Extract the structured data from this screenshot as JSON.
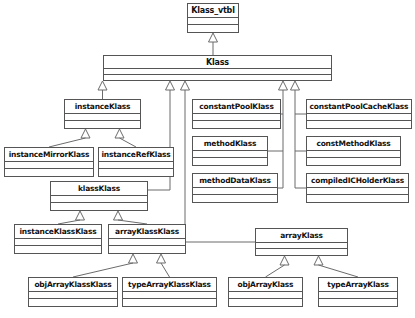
{
  "diagram": {
    "type": "uml-class-diagram",
    "background_color": "#ffffff",
    "box_fill_color": "#ffffff",
    "box_border_color": "#555555",
    "text_color": "#111111",
    "edge_color": "#6b6b6b",
    "relationship_type": "generalization",
    "caption": "",
    "classes": [
      {
        "id": "klass_vtbl",
        "name": "Klass_vtbl",
        "x": 187,
        "y": 3,
        "w": 52,
        "h": 30,
        "font_size": 8,
        "name_h": 14
      },
      {
        "id": "klass",
        "name": "Klass",
        "x": 103,
        "y": 55,
        "w": 229,
        "h": 26,
        "font_size": 8,
        "name_h": 13
      },
      {
        "id": "instanceKlass",
        "name": "instanceKlass",
        "x": 64,
        "y": 99,
        "w": 77,
        "h": 30,
        "font_size": 7.5,
        "name_h": 14
      },
      {
        "id": "constantPoolKlass",
        "name": "constantPoolKlass",
        "x": 192,
        "y": 99,
        "w": 89,
        "h": 30,
        "font_size": 7.5,
        "name_h": 14
      },
      {
        "id": "constantPoolCacheKlass",
        "name": "constantPoolCacheKlass",
        "x": 306,
        "y": 99,
        "w": 106,
        "h": 30,
        "font_size": 7.5,
        "name_h": 14
      },
      {
        "id": "methodKlass",
        "name": "methodKlass",
        "x": 192,
        "y": 136,
        "w": 76,
        "h": 30,
        "font_size": 7.5,
        "name_h": 14
      },
      {
        "id": "constMethodKlass",
        "name": "constMethodKlass",
        "x": 306,
        "y": 136,
        "w": 95,
        "h": 30,
        "font_size": 7.5,
        "name_h": 14
      },
      {
        "id": "instanceMirrorKlass",
        "name": "instanceMirrorKlass",
        "x": 4,
        "y": 147,
        "w": 90,
        "h": 30,
        "font_size": 7.5,
        "name_h": 14
      },
      {
        "id": "instanceRefKlass",
        "name": "instanceRefKlass",
        "x": 98,
        "y": 147,
        "w": 76,
        "h": 30,
        "font_size": 7.5,
        "name_h": 14
      },
      {
        "id": "methodDataKlass",
        "name": "methodDataKlass",
        "x": 192,
        "y": 173,
        "w": 86,
        "h": 30,
        "font_size": 7.5,
        "name_h": 14
      },
      {
        "id": "compiledICHolderKlass",
        "name": "compiledICHolderKlass",
        "x": 306,
        "y": 173,
        "w": 103,
        "h": 30,
        "font_size": 7.5,
        "name_h": 14
      },
      {
        "id": "klassKlass",
        "name": "klassKlass",
        "x": 50,
        "y": 181,
        "w": 98,
        "h": 30,
        "font_size": 7.5,
        "name_h": 14
      },
      {
        "id": "instanceKlassKlass",
        "name": "instanceKlassKlass",
        "x": 14,
        "y": 224,
        "w": 88,
        "h": 30,
        "font_size": 7.5,
        "name_h": 14
      },
      {
        "id": "arrayKlassKlass",
        "name": "arrayKlassKlass",
        "x": 108,
        "y": 224,
        "w": 78,
        "h": 30,
        "font_size": 7.5,
        "name_h": 14
      },
      {
        "id": "arrayKlass",
        "name": "arrayKlass",
        "x": 255,
        "y": 228,
        "w": 93,
        "h": 28,
        "font_size": 7.5,
        "name_h": 14
      },
      {
        "id": "objArrayKlassKlass",
        "name": "objArrayKlassKlass",
        "x": 28,
        "y": 277,
        "w": 90,
        "h": 30,
        "font_size": 7.5,
        "name_h": 14
      },
      {
        "id": "typeArrayKlassKlass",
        "name": "typeArrayKlassKlass",
        "x": 122,
        "y": 277,
        "w": 95,
        "h": 30,
        "font_size": 7.5,
        "name_h": 14
      },
      {
        "id": "objArrayKlass",
        "name": "objArrayKlass",
        "x": 228,
        "y": 277,
        "w": 75,
        "h": 30,
        "font_size": 7.5,
        "name_h": 14
      },
      {
        "id": "typeArrayKlass",
        "name": "typeArrayKlass",
        "x": 318,
        "y": 277,
        "w": 80,
        "h": 30,
        "font_size": 7.5,
        "name_h": 14
      }
    ],
    "edges": [
      {
        "from": "klass",
        "to": "klass_vtbl",
        "label": "extends"
      },
      {
        "from": "instanceKlass",
        "to": "klass",
        "label": "extends"
      },
      {
        "from": "klassKlass",
        "to": "klass",
        "label": "extends"
      },
      {
        "from": "arrayKlass",
        "to": "klass",
        "label": "extends"
      },
      {
        "from": "constantPoolKlass",
        "to": "klass",
        "label": "extends"
      },
      {
        "from": "methodKlass",
        "to": "klass",
        "label": "extends"
      },
      {
        "from": "methodDataKlass",
        "to": "klass",
        "label": "extends"
      },
      {
        "from": "constantPoolCacheKlass",
        "to": "klass",
        "label": "extends"
      },
      {
        "from": "constMethodKlass",
        "to": "klass",
        "label": "extends"
      },
      {
        "from": "compiledICHolderKlass",
        "to": "klass",
        "label": "extends"
      },
      {
        "from": "instanceMirrorKlass",
        "to": "instanceKlass",
        "label": "extends"
      },
      {
        "from": "instanceRefKlass",
        "to": "instanceKlass",
        "label": "extends"
      },
      {
        "from": "instanceKlassKlass",
        "to": "klassKlass",
        "label": "extends"
      },
      {
        "from": "arrayKlassKlass",
        "to": "klassKlass",
        "label": "extends"
      },
      {
        "from": "objArrayKlassKlass",
        "to": "arrayKlassKlass",
        "label": "extends"
      },
      {
        "from": "typeArrayKlassKlass",
        "to": "arrayKlassKlass",
        "label": "extends"
      },
      {
        "from": "objArrayKlass",
        "to": "arrayKlass",
        "label": "extends"
      },
      {
        "from": "typeArrayKlass",
        "to": "arrayKlass",
        "label": "extends"
      }
    ]
  }
}
